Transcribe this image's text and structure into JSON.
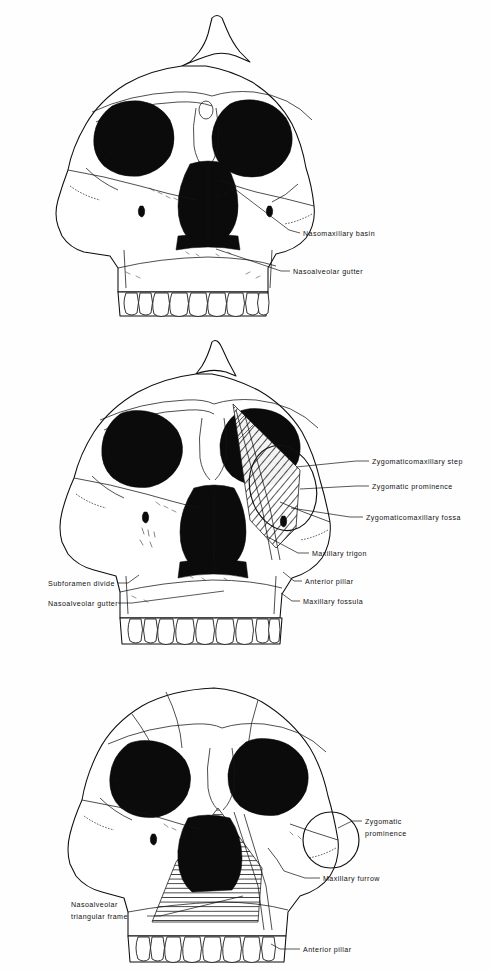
{
  "figure": {
    "type": "scientific-illustration",
    "panel_count": 3,
    "background_color": "#ffffff",
    "ink_color": "#111111",
    "label_font_size_px": 7
  },
  "panels": [
    {
      "id": "panel-1",
      "order": 1,
      "description": "Anterior view of robust hominid cranium with sagittal crest, large orbits, flaring zygomatics and maxillary tooth row",
      "features": {
        "sagittal_crest": true,
        "orbits": 2,
        "nasal_aperture": true,
        "tooth_row": true,
        "hatching": "none"
      },
      "labels": [
        {
          "id": "p1-l1",
          "text": "Nasomaxillary basin",
          "text_x": 303,
          "text_y": 236,
          "leader": "M 300,233 L 289,230 L 231,186"
        },
        {
          "id": "p1-l2",
          "text": "Nasoalveolar gutter",
          "text_x": 293,
          "text_y": 274,
          "leader": "M 290,271 L 281,271 L 216,249"
        }
      ]
    },
    {
      "id": "panel-2",
      "order": 2,
      "description": "Anterior view of cranium with diagonal hatching marking the maxillary trigon and zygomaticomaxillary region; oval outline encircles the zygomatic prominence",
      "features": {
        "sagittal_crest": true,
        "orbits": 2,
        "nasal_aperture": true,
        "tooth_row": true,
        "hatching": "diagonal-45deg",
        "marker_shape": "ellipse"
      },
      "labels": [
        {
          "id": "p2-l1",
          "text": "Zygomaticomaxillary step",
          "text_x": 372,
          "text_y": 464,
          "leader": "M 369,461 L 356,461 L 296,467"
        },
        {
          "id": "p2-l2",
          "text": "Zygomatic prominence",
          "text_x": 372,
          "text_y": 489,
          "leader": "M 369,486 L 356,486 L 300,489"
        },
        {
          "id": "p2-l3",
          "text": "Zygomaticomaxillary fossa",
          "text_x": 366,
          "text_y": 520,
          "leader": "M 363,517 L 350,517 L 291,508"
        },
        {
          "id": "p2-l4",
          "text": "Maxillary trigon",
          "text_x": 312,
          "text_y": 556,
          "leader": "M 309,553 L 298,553 L 266,536"
        },
        {
          "id": "p2-l5",
          "text": "Anterior pillar",
          "text_x": 305,
          "text_y": 584,
          "leader": "M 302,581 L 294,581 L 283,572"
        },
        {
          "id": "p2-l6",
          "text": "Maxillary fossula",
          "text_x": 303,
          "text_y": 604,
          "leader": "M 300,601 L 292,601 L 281,593"
        },
        {
          "id": "p2-l7",
          "text": "Subforamen divide",
          "text_x": 48,
          "text_y": 586,
          "leader": "M 118,583 L 128,583 L 139,575",
          "anchor": "start-left"
        },
        {
          "id": "p2-l8",
          "text": "Nasoalveolar gutter",
          "text_x": 48,
          "text_y": 606,
          "leader": "M 118,603 L 132,603 L 224,591",
          "anchor": "start-left"
        }
      ]
    },
    {
      "id": "panel-3",
      "order": 3,
      "description": "Anterior view of cranium with horizontal hatching forming a nasoalveolar triangular frame; circular outline marks the zygomatic prominence",
      "features": {
        "sagittal_crest": false,
        "orbits": 2,
        "nasal_aperture": true,
        "tooth_row": true,
        "hatching": "horizontal",
        "marker_shape": "circle"
      },
      "labels": [
        {
          "id": "p3-l1",
          "text": "Zygomatic",
          "text_x": 365,
          "text_y": 824,
          "leader": "M 362,821 L 352,821 L 338,828"
        },
        {
          "id": "p3-l2",
          "text": "prominence",
          "text_x": 365,
          "text_y": 834,
          "leader": ""
        },
        {
          "id": "p3-l3",
          "text": "Maxillary furrow",
          "text_x": 323,
          "text_y": 881,
          "leader": "M 320,878 L 305,878 L 284,871"
        },
        {
          "id": "p3-l4",
          "text": "Nasoalveolar",
          "text_x": 71,
          "text_y": 907,
          "leader": ""
        },
        {
          "id": "p3-l5",
          "text": "triangular frame",
          "text_x": 71,
          "text_y": 919,
          "leader": "M 147,916 L 160,916 L 243,896",
          "anchor": "start-left"
        },
        {
          "id": "p3-l6",
          "text": "Anterior pillar",
          "text_x": 303,
          "text_y": 952,
          "leader": "M 300,949 L 280,949 L 271,944"
        }
      ]
    }
  ]
}
